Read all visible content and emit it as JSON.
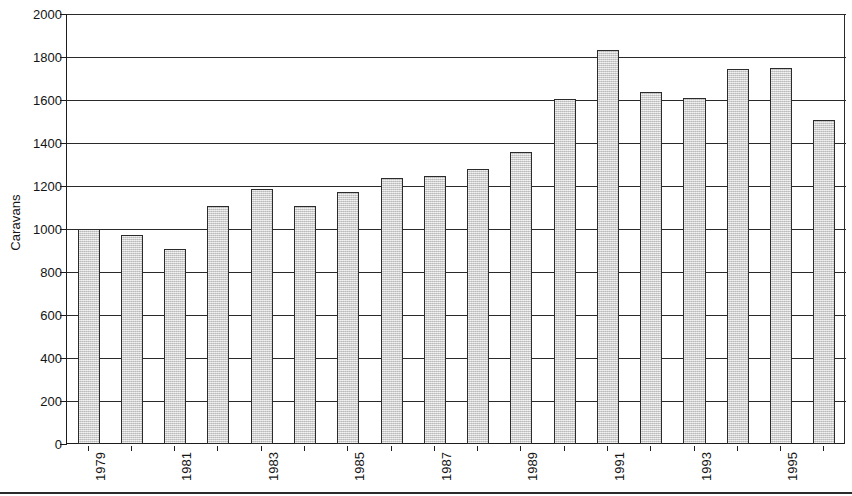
{
  "chart_data": {
    "type": "bar",
    "title": "",
    "xlabel": "",
    "ylabel": "Caravans",
    "ylim": [
      0,
      2000
    ],
    "ytick_step": 200,
    "yticks": [
      0,
      200,
      400,
      600,
      800,
      1000,
      1200,
      1400,
      1600,
      1800,
      2000
    ],
    "ytick_labels": [
      "0",
      "200",
      "400",
      "600",
      "800",
      "1000",
      "1200",
      "1400",
      "1600",
      "1800",
      "2000"
    ],
    "grid": true,
    "legend": null,
    "categories": [
      "1979",
      "1980",
      "1981",
      "1982",
      "1983",
      "1984",
      "1985",
      "1986",
      "1987",
      "1988",
      "1989",
      "1990",
      "1991",
      "1992",
      "1993",
      "1994",
      "1995",
      "1996"
    ],
    "xtick_labels_shown": [
      "1979",
      "1981",
      "1983",
      "1985",
      "1987",
      "1989",
      "1991",
      "1993",
      "1995"
    ],
    "xtick_label_rotation": 90,
    "values": [
      1000,
      970,
      905,
      1105,
      1188,
      1108,
      1172,
      1237,
      1245,
      1280,
      1358,
      1605,
      1832,
      1637,
      1608,
      1742,
      1750,
      1508
    ],
    "series": [
      {
        "name": "Caravans",
        "values": [
          1000,
          970,
          905,
          1105,
          1188,
          1108,
          1172,
          1237,
          1245,
          1280,
          1358,
          1605,
          1832,
          1637,
          1608,
          1742,
          1750,
          1508
        ]
      }
    ],
    "bar_fill_color": "#d2d2d2",
    "bar_border_color": "#2b2b2b",
    "axis_color": "#1c1c1c",
    "background_color": "#ffffff"
  }
}
